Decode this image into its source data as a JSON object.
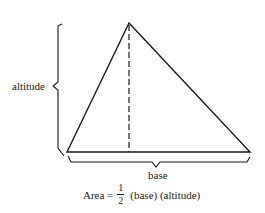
{
  "diagram": {
    "labels": {
      "altitude": "altitude",
      "base": "base"
    },
    "formula": {
      "lhs": "Area =",
      "numerator": "1",
      "denominator": "2",
      "rhs": "(base) (altitude)"
    },
    "shape": "triangle",
    "apex": [
      129,
      23
    ],
    "base_left": [
      67,
      152
    ],
    "base_right": [
      250,
      152
    ]
  }
}
